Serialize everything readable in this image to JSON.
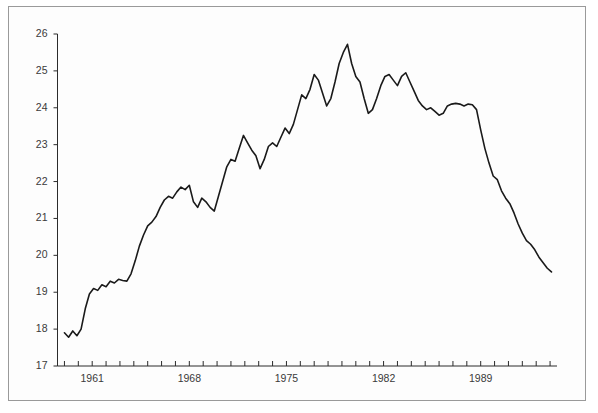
{
  "figure": {
    "title_fragment": "",
    "background_color": "#fdfdfd",
    "frame_color": "#9a9a9a",
    "line_color": "#1a1a1a"
  },
  "chart_data": {
    "type": "line",
    "title": "",
    "subtitle": "",
    "xlabel": "",
    "ylabel": "",
    "xlim": [
      1958.5,
      1994.5
    ],
    "ylim": [
      17,
      26
    ],
    "grid": false,
    "legend": null,
    "y_ticks": [
      17,
      18,
      19,
      20,
      21,
      22,
      23,
      24,
      25,
      26
    ],
    "y_tick_labels": [
      "17",
      "18",
      "19",
      "20",
      "21",
      "22",
      "23",
      "24",
      "25",
      "26"
    ],
    "x_tick_labels": [
      "1961",
      "1968",
      "1975",
      "1982",
      "1989"
    ],
    "x_tick_label_values": [
      1961,
      1968,
      1975,
      1982,
      1989
    ],
    "x_minor_ticks": [
      1959,
      1960,
      1961,
      1962,
      1963,
      1964,
      1965,
      1966,
      1967,
      1968,
      1969,
      1970,
      1971,
      1972,
      1973,
      1974,
      1975,
      1976,
      1977,
      1978,
      1979,
      1980,
      1981,
      1982,
      1983,
      1984,
      1985,
      1986,
      1987,
      1988,
      1989,
      1990,
      1991,
      1992,
      1993,
      1994
    ],
    "series": [
      {
        "name": "series-1",
        "color": "#1a1a1a",
        "x": [
          1959.0,
          1959.3,
          1959.6,
          1959.9,
          1960.2,
          1960.5,
          1960.8,
          1961.1,
          1961.4,
          1961.7,
          1962.0,
          1962.3,
          1962.6,
          1962.9,
          1963.2,
          1963.5,
          1963.8,
          1964.1,
          1964.4,
          1964.7,
          1965.0,
          1965.3,
          1965.6,
          1965.9,
          1966.2,
          1966.5,
          1966.8,
          1967.1,
          1967.4,
          1967.7,
          1968.0,
          1968.3,
          1968.6,
          1968.9,
          1969.2,
          1969.5,
          1969.8,
          1970.1,
          1970.4,
          1970.7,
          1971.0,
          1971.3,
          1971.6,
          1971.9,
          1972.2,
          1972.5,
          1972.8,
          1973.1,
          1973.4,
          1973.7,
          1974.0,
          1974.3,
          1974.6,
          1974.9,
          1975.2,
          1975.5,
          1975.8,
          1976.1,
          1976.4,
          1976.7,
          1977.0,
          1977.3,
          1977.6,
          1977.9,
          1978.2,
          1978.5,
          1978.8,
          1979.1,
          1979.4,
          1979.7,
          1980.0,
          1980.3,
          1980.6,
          1980.9,
          1981.2,
          1981.5,
          1981.8,
          1982.1,
          1982.4,
          1982.7,
          1983.0,
          1983.3,
          1983.6,
          1983.9,
          1984.2,
          1984.5,
          1984.8,
          1985.1,
          1985.4,
          1985.7,
          1986.0,
          1986.3,
          1986.6,
          1986.9,
          1987.2,
          1987.5,
          1987.8,
          1988.1,
          1988.4,
          1988.7,
          1989.0,
          1989.3,
          1989.6,
          1989.9,
          1990.2,
          1990.5,
          1990.8,
          1991.1,
          1991.4,
          1991.7,
          1992.0,
          1992.3,
          1992.6,
          1992.9,
          1993.2,
          1993.5,
          1993.8,
          1994.1
        ],
        "y": [
          17.9,
          17.78,
          17.95,
          17.82,
          18.0,
          18.55,
          18.95,
          19.1,
          19.05,
          19.2,
          19.15,
          19.3,
          19.25,
          19.35,
          19.32,
          19.3,
          19.5,
          19.85,
          20.25,
          20.55,
          20.8,
          20.9,
          21.05,
          21.3,
          21.5,
          21.6,
          21.55,
          21.72,
          21.85,
          21.78,
          21.9,
          21.45,
          21.3,
          21.55,
          21.45,
          21.3,
          21.2,
          21.6,
          22.0,
          22.4,
          22.6,
          22.55,
          22.9,
          23.25,
          23.05,
          22.85,
          22.7,
          22.35,
          22.6,
          22.95,
          23.05,
          22.95,
          23.2,
          23.45,
          23.3,
          23.55,
          23.95,
          24.35,
          24.25,
          24.5,
          24.9,
          24.75,
          24.4,
          24.05,
          24.25,
          24.7,
          25.2,
          25.5,
          25.72,
          25.2,
          24.85,
          24.7,
          24.25,
          23.85,
          23.95,
          24.25,
          24.6,
          24.85,
          24.9,
          24.75,
          24.6,
          24.85,
          24.95,
          24.7,
          24.45,
          24.2,
          24.05,
          23.95,
          24.0,
          23.9,
          23.8,
          23.85,
          24.05,
          24.1,
          24.12,
          24.1,
          24.05,
          24.1,
          24.08,
          23.95,
          23.4,
          22.9,
          22.5,
          22.15,
          22.05,
          21.75,
          21.55,
          21.4,
          21.15,
          20.85,
          20.6,
          20.4,
          20.3,
          20.15,
          19.95,
          19.8,
          19.65,
          19.55
        ]
      }
    ]
  }
}
